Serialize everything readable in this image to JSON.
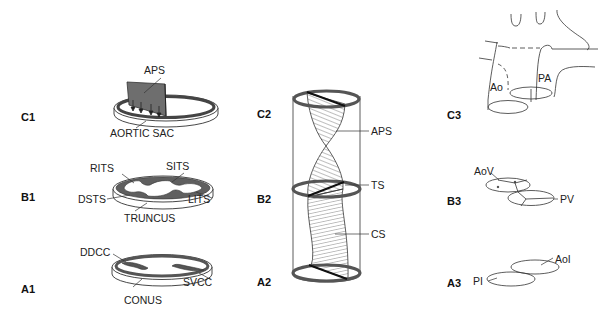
{
  "figure": {
    "rows": [
      "C",
      "B",
      "A"
    ],
    "columns": [
      "1",
      "2",
      "3"
    ]
  },
  "panels": {
    "C1": {
      "label": "C1",
      "structure": "aortic sac with aortopulmonary septum",
      "labels": {
        "septum": "APS",
        "base": "AORTIC SAC"
      }
    },
    "B1": {
      "label": "B1",
      "structure": "truncus with truncal swellings",
      "labels": {
        "top_left": "RITS",
        "top_right": "SITS",
        "left": "DSTS",
        "right": "LITS",
        "base": "TRUNCUS"
      }
    },
    "A1": {
      "label": "A1",
      "structure": "conus with conal cushions",
      "labels": {
        "left": "DDCC",
        "right": "SVCC",
        "base": "CONUS"
      }
    },
    "C2": {
      "label": "C2",
      "pointer": "APS"
    },
    "B2": {
      "label": "B2",
      "pointer": "TS"
    },
    "A2": {
      "label": "A2",
      "pointer": "CS"
    },
    "C3": {
      "label": "C3",
      "labels": {
        "aorta": "Ao",
        "pulmonary_artery": "PA"
      }
    },
    "B3": {
      "label": "B3",
      "labels": {
        "aortic_valve": "AoV",
        "pulmonary_valve": "PV"
      }
    },
    "A3": {
      "label": "A3",
      "labels": {
        "aortic_infundibulum": "AoI",
        "pulmonary_infundibulum": "PI"
      }
    }
  },
  "colors": {
    "line": "#333333",
    "ring": "#555555",
    "septum_fill": "#6e6e6e",
    "background": "#ffffff"
  }
}
